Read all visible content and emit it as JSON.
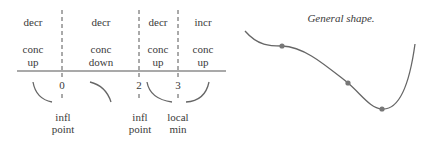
{
  "sign_chart": {
    "intervals": [
      {
        "monotonic": "decr",
        "concavity_line1": "conc",
        "concavity_line2": "up"
      },
      {
        "monotonic": "decr",
        "concavity_line1": "conc",
        "concavity_line2": "down"
      },
      {
        "monotonic": "decr",
        "concavity_line1": "conc",
        "concavity_line2": "up"
      },
      {
        "monotonic": "incr",
        "concavity_line1": "conc",
        "concavity_line2": "up"
      }
    ],
    "critical_points": [
      {
        "x_label": "0",
        "note_line1": "infl",
        "note_line2": "point"
      },
      {
        "x_label": "2",
        "note_line1": "infl",
        "note_line2": "point"
      },
      {
        "x_label": "3",
        "note_line1": "local",
        "note_line2": "min"
      }
    ]
  },
  "graph": {
    "title": "General shape.",
    "marked_points": [
      "inflection at x=0",
      "inflection at x=2",
      "local min at x=3"
    ]
  }
}
